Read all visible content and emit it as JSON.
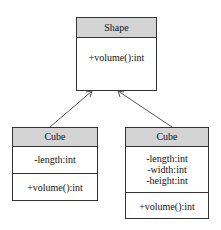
{
  "diagram": {
    "type": "uml-class-diagram",
    "classes": [
      {
        "name": "Shape",
        "attributes": [],
        "methods": [
          "+volume():int"
        ]
      },
      {
        "name": "Cube",
        "attributes": [
          "-length:int"
        ],
        "methods": [
          "+volume():int"
        ]
      },
      {
        "name": "Cube",
        "attributes": [
          "-length:int",
          "-width:int",
          "-height:int"
        ],
        "methods": [
          "+volume():int"
        ]
      }
    ],
    "relations": [
      {
        "from": 1,
        "to": 0,
        "type": "inheritance"
      },
      {
        "from": 2,
        "to": 0,
        "type": "inheritance"
      }
    ]
  },
  "shape": {
    "name": "Shape",
    "method": "+volume():int"
  },
  "cube_left": {
    "name": "Cube",
    "attr": "-length:int",
    "method": "+volume():int"
  },
  "cube_right": {
    "name": "Cube",
    "attr1": "-length:int",
    "attr2": "-width:int",
    "attr3": "-height:int",
    "method": "+volume():int"
  }
}
